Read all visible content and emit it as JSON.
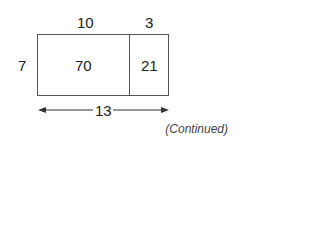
{
  "diagram": {
    "top_labels": {
      "left_width": "10",
      "right_width": "3"
    },
    "side_label": "7",
    "cells": {
      "left_area": "70",
      "right_area": "21"
    },
    "total_width": "13",
    "note": "(Continued)"
  }
}
